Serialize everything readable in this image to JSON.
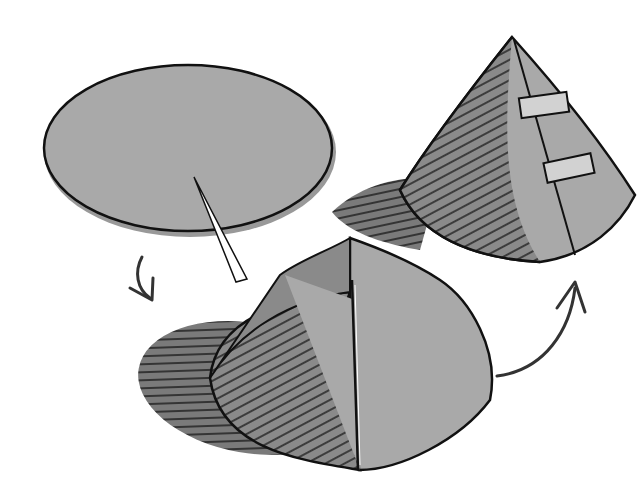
{
  "illustration": {
    "subject": "Making a paper cone from a circle with a slit",
    "steps": [
      {
        "id": "disc",
        "description": "Flat circular disc with a radial cut"
      },
      {
        "id": "partial-cone",
        "description": "Disc overlapped into a shallow cone"
      },
      {
        "id": "finished-cone",
        "description": "Tall cone with seam secured by two pieces of tape"
      }
    ],
    "arrows": [
      {
        "id": "arrow-down",
        "from": "disc",
        "to": "partial-cone"
      },
      {
        "id": "arrow-up",
        "from": "partial-cone",
        "to": "finished-cone"
      }
    ],
    "colors": {
      "background": "#ffffff",
      "paper": "#a9a9a9",
      "paper_shade": "#8a8a8a",
      "shadow": "#7a7a7a",
      "outline": "#111111",
      "tape": "#d2d2d2"
    }
  }
}
